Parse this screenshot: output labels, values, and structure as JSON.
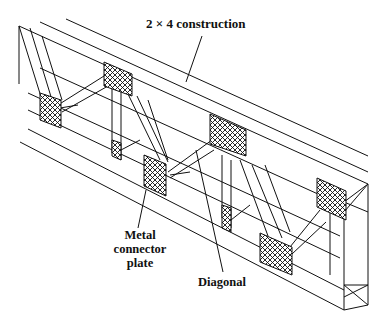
{
  "figure": {
    "labels": {
      "construction": "2 × 4 construction",
      "plate_line1": "Metal",
      "plate_line2": "connector",
      "plate_line3": "plate",
      "diagonal": "Diagonal"
    },
    "colors": {
      "line": "#111111",
      "background": "#ffffff"
    }
  }
}
